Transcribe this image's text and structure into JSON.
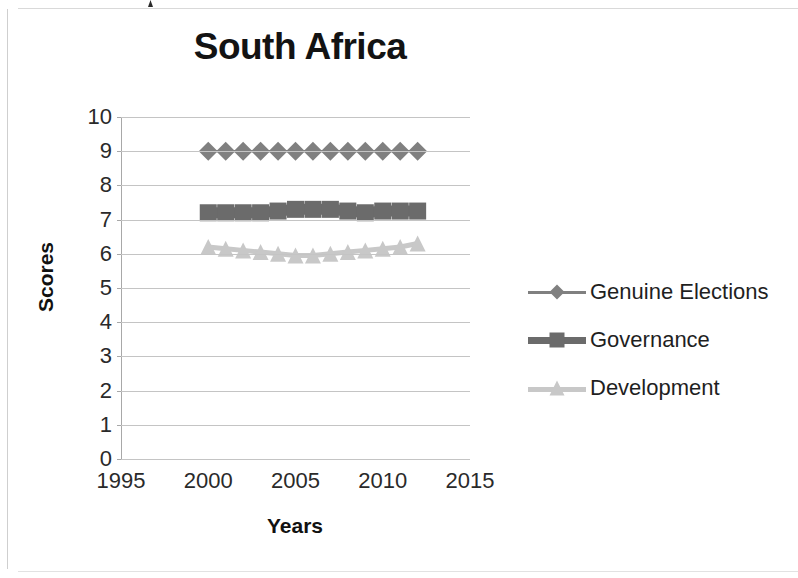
{
  "chart_data": {
    "type": "line",
    "title": "South Africa",
    "xlabel": "Years",
    "ylabel": "Scores",
    "xlim": [
      1995,
      2015
    ],
    "ylim": [
      0,
      10
    ],
    "x_ticks": [
      1995,
      2000,
      2005,
      2010,
      2015
    ],
    "y_ticks": [
      0,
      1,
      2,
      3,
      4,
      5,
      6,
      7,
      8,
      9,
      10
    ],
    "grid": true,
    "legend_position": "right",
    "x": [
      2000,
      2001,
      2002,
      2003,
      2004,
      2005,
      2006,
      2007,
      2008,
      2009,
      2010,
      2011,
      2012
    ],
    "series": [
      {
        "name": "Genuine Elections",
        "marker": "diamond",
        "color": "#808080",
        "values": [
          9,
          9,
          9,
          9,
          9,
          9,
          9,
          9,
          9,
          9,
          9,
          9,
          9
        ]
      },
      {
        "name": "Governance",
        "marker": "square",
        "color": "#6b6b6b",
        "values": [
          7.2,
          7.2,
          7.2,
          7.2,
          7.25,
          7.3,
          7.3,
          7.3,
          7.25,
          7.2,
          7.25,
          7.25,
          7.25
        ]
      },
      {
        "name": "Development",
        "marker": "triangle",
        "color": "#c8c8c8",
        "values": [
          6.2,
          6.15,
          6.1,
          6.05,
          6.0,
          5.95,
          5.95,
          6.0,
          6.05,
          6.1,
          6.15,
          6.2,
          6.3
        ]
      }
    ]
  },
  "axis": {
    "y_tick_labels": [
      "10",
      "9",
      "8",
      "7",
      "6",
      "5",
      "4",
      "3",
      "2",
      "1",
      "0"
    ],
    "x_tick_labels": [
      "1995",
      "2000",
      "2005",
      "2010",
      "2015"
    ]
  },
  "legend": {
    "items": [
      {
        "label": "Genuine Elections",
        "color": "#808080",
        "marker": "diamond"
      },
      {
        "label": "Governance",
        "color": "#6b6b6b",
        "marker": "square"
      },
      {
        "label": "Development",
        "color": "#c8c8c8",
        "marker": "triangle"
      }
    ]
  }
}
